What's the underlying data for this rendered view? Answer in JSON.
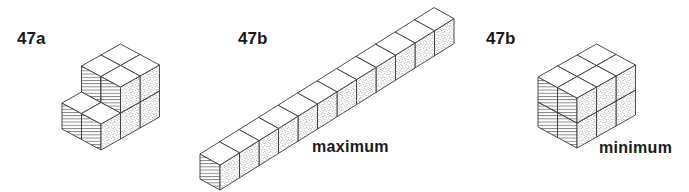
{
  "figures": [
    {
      "id": "47a",
      "label": "47a",
      "caption": "",
      "label_pos": [
        17,
        30
      ],
      "origin": [
        101,
        150
      ],
      "vectors": {
        "R": [
          19.5,
          -11
        ],
        "L": [
          -19.5,
          -10.5
        ],
        "H": [
          0,
          -26
        ]
      },
      "cubes": [
        [
          0,
          0,
          0
        ],
        [
          0,
          1,
          0
        ],
        [
          1,
          0,
          0
        ],
        [
          1,
          1,
          0
        ],
        [
          2,
          0,
          0
        ],
        [
          2,
          1,
          0
        ],
        [
          1,
          0,
          1
        ],
        [
          1,
          1,
          1
        ],
        [
          2,
          0,
          1
        ],
        [
          2,
          1,
          1
        ]
      ]
    },
    {
      "id": "47b-maximum",
      "label": "47b",
      "caption": "maximum",
      "label_pos": [
        238,
        30
      ],
      "caption_pos": [
        312,
        139
      ],
      "origin": [
        220,
        190
      ],
      "vectors": {
        "R": [
          19.5,
          -12.2
        ],
        "L": [
          -20,
          -11
        ],
        "H": [
          0,
          -25
        ]
      },
      "cubes": [
        [
          0,
          0,
          0
        ],
        [
          1,
          0,
          0
        ],
        [
          2,
          0,
          0
        ],
        [
          3,
          0,
          0
        ],
        [
          4,
          0,
          0
        ],
        [
          5,
          0,
          0
        ],
        [
          6,
          0,
          0
        ],
        [
          7,
          0,
          0
        ],
        [
          8,
          0,
          0
        ],
        [
          9,
          0,
          0
        ],
        [
          10,
          0,
          0
        ],
        [
          11,
          0,
          0
        ]
      ]
    },
    {
      "id": "47b-minimum",
      "label": "47b",
      "caption": "minimum",
      "label_pos": [
        486,
        30
      ],
      "caption_pos": [
        599,
        140
      ],
      "origin": [
        577,
        148
      ],
      "vectors": {
        "R": [
          19.5,
          -11
        ],
        "L": [
          -19.5,
          -10.5
        ],
        "H": [
          0,
          -25
        ]
      },
      "cubes": [
        [
          0,
          0,
          0
        ],
        [
          0,
          1,
          0
        ],
        [
          1,
          0,
          0
        ],
        [
          1,
          1,
          0
        ],
        [
          2,
          0,
          0
        ],
        [
          2,
          1,
          0
        ],
        [
          0,
          0,
          1
        ],
        [
          0,
          1,
          1
        ],
        [
          1,
          0,
          1
        ],
        [
          1,
          1,
          1
        ],
        [
          2,
          0,
          1
        ],
        [
          2,
          1,
          1
        ]
      ]
    }
  ],
  "style": {
    "stroke": "#3a3a3a",
    "top_fill": "#ffffff",
    "left_face": "horizontal-hatch",
    "right_face": "stipple"
  }
}
